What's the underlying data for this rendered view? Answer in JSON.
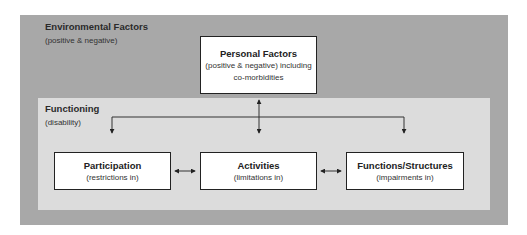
{
  "diagram": {
    "environmental": {
      "title": "Environmental Factors",
      "subtitle": "(positive & negative)"
    },
    "personal": {
      "title": "Personal Factors",
      "line1": "(positive & negative) including",
      "line2": "co-morbidities"
    },
    "functioning": {
      "title": "Functioning",
      "subtitle": "(disability)"
    },
    "boxes": [
      {
        "title": "Participation",
        "subtitle": "(restrictions in)"
      },
      {
        "title": "Activities",
        "subtitle": "(limitations in)"
      },
      {
        "title": "Functions/Structures",
        "subtitle": "(impairments in)"
      }
    ],
    "connections": [
      {
        "from": "Personal Factors",
        "to": "Functioning",
        "type": "bidirectional"
      },
      {
        "from": "Personal Factors",
        "to": "Participation",
        "type": "directed"
      },
      {
        "from": "Personal Factors",
        "to": "Activities",
        "type": "directed"
      },
      {
        "from": "Personal Factors",
        "to": "Functions/Structures",
        "type": "directed"
      },
      {
        "from": "Participation",
        "to": "Activities",
        "type": "bidirectional"
      },
      {
        "from": "Activities",
        "to": "Functions/Structures",
        "type": "bidirectional"
      }
    ],
    "colors": {
      "outer_bg": "#a8a8a8",
      "inner_bg": "#dcdcdc",
      "box_bg": "#ffffff",
      "stroke": "#222222"
    }
  }
}
